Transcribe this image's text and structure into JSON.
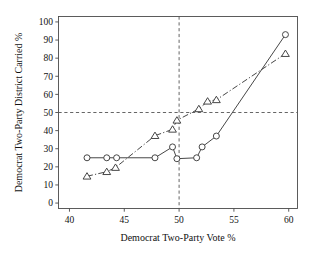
{
  "chart_data": {
    "type": "line",
    "title": "",
    "subtitle": "",
    "xlabel": "Democrat Two-Party Vote %",
    "ylabel": "Democrat Two-Party District Carried %",
    "xlim": [
      39.0,
      60.8
    ],
    "ylim": [
      -3,
      103
    ],
    "xticks": [
      40,
      45,
      50,
      55,
      60
    ],
    "yticks": [
      0,
      10,
      20,
      30,
      40,
      50,
      60,
      70,
      80,
      90,
      100
    ],
    "xtick_labels": [
      "40",
      "45",
      "50",
      "55",
      "60"
    ],
    "ytick_labels": [
      "0",
      "10",
      "20",
      "30",
      "40",
      "50",
      "60",
      "70",
      "80",
      "90",
      "100"
    ],
    "grid": false,
    "legend": null,
    "legend_position": "none",
    "reference_lines": [
      {
        "name": "vertical-50-percent-vote",
        "axis": "x",
        "value": 50,
        "style": "dashed"
      },
      {
        "name": "horizontal-50-percent-districts",
        "axis": "y",
        "value": 50,
        "style": "dashed"
      }
    ],
    "series": [
      {
        "name": "circle-series",
        "marker": "circle",
        "line_style": "solid",
        "color": "#3d3d3d",
        "points": [
          {
            "x": 41.6,
            "y": 25.0
          },
          {
            "x": 43.4,
            "y": 25.0
          },
          {
            "x": 44.3,
            "y": 25.0
          },
          {
            "x": 47.8,
            "y": 25.0
          },
          {
            "x": 49.4,
            "y": 31.0
          },
          {
            "x": 49.8,
            "y": 24.5
          },
          {
            "x": 51.6,
            "y": 25.0
          },
          {
            "x": 52.1,
            "y": 31.0
          },
          {
            "x": 53.4,
            "y": 37.0
          },
          {
            "x": 59.7,
            "y": 93.0
          }
        ]
      },
      {
        "name": "triangle-series",
        "marker": "triangle",
        "line_style": "dash-dot",
        "color": "#3d3d3d",
        "points": [
          {
            "x": 41.6,
            "y": 14.8
          },
          {
            "x": 43.4,
            "y": 17.3
          },
          {
            "x": 44.2,
            "y": 19.6
          },
          {
            "x": 47.8,
            "y": 37.2
          },
          {
            "x": 49.4,
            "y": 40.7
          },
          {
            "x": 49.8,
            "y": 45.7
          },
          {
            "x": 51.8,
            "y": 52.0
          },
          {
            "x": 52.6,
            "y": 56.2
          },
          {
            "x": 53.4,
            "y": 57.0
          },
          {
            "x": 59.7,
            "y": 82.5
          }
        ]
      }
    ]
  }
}
